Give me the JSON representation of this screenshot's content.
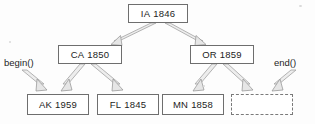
{
  "diagram": {
    "background_color": "#fdfdfd",
    "node_border_color": "#6e6e6e",
    "text_color": "#1d1d1d",
    "arrow_fill_color": "#e8e8e8",
    "arrow_stroke_color": "#9a9a9a",
    "nodes": [
      {
        "id": "root",
        "state": "IA",
        "year": "1846",
        "x": 128,
        "y": 4,
        "w": 60,
        "h": 19,
        "style": "solid"
      },
      {
        "id": "left",
        "state": "CA",
        "year": "1850",
        "x": 58,
        "y": 45,
        "w": 64,
        "h": 19,
        "style": "solid"
      },
      {
        "id": "right",
        "state": "OR",
        "year": "1859",
        "x": 190,
        "y": 45,
        "w": 64,
        "h": 19,
        "style": "solid"
      },
      {
        "id": "leaf1",
        "state": "AK",
        "year": "1959",
        "x": 27,
        "y": 94,
        "w": 62,
        "h": 21,
        "style": "solid"
      },
      {
        "id": "leaf2",
        "state": "FL",
        "year": "1845",
        "x": 97,
        "y": 94,
        "w": 62,
        "h": 21,
        "style": "solid"
      },
      {
        "id": "leaf3",
        "state": "MN",
        "year": "1858",
        "x": 162,
        "y": 94,
        "w": 62,
        "h": 21,
        "style": "solid"
      },
      {
        "id": "leaf4",
        "state": "",
        "year": "",
        "x": 231,
        "y": 94,
        "w": 62,
        "h": 21,
        "style": "dashed"
      }
    ],
    "callouts": [
      {
        "id": "begin",
        "label": "begin()",
        "x": 4,
        "y": 58
      },
      {
        "id": "end",
        "label": "end()",
        "x": 274,
        "y": 58
      }
    ],
    "edges": [
      {
        "from": "root",
        "to": "left",
        "kind": "tree"
      },
      {
        "from": "root",
        "to": "right",
        "kind": "tree"
      },
      {
        "from": "left",
        "to": "leaf1",
        "kind": "tree"
      },
      {
        "from": "left",
        "to": "leaf2",
        "kind": "tree"
      },
      {
        "from": "right",
        "to": "leaf3",
        "kind": "tree"
      },
      {
        "from": "right",
        "to": "leaf4",
        "kind": "tree"
      },
      {
        "from": "begin",
        "to": "leaf1",
        "kind": "iterator"
      },
      {
        "from": "end",
        "to": "leaf4",
        "kind": "iterator"
      }
    ]
  }
}
